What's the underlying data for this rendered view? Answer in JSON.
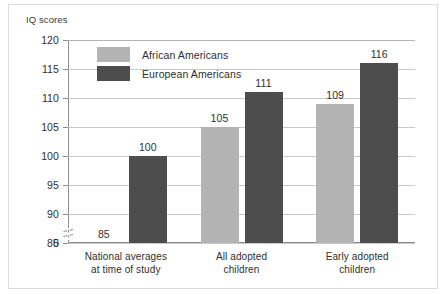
{
  "figure": {
    "axis_title": "IQ scores",
    "colors": {
      "series_light": "#b3b3b3",
      "series_dark": "#4d4d4d",
      "gridline": "#c9c9c9",
      "axis": "#8c8c8c",
      "text": "#2f2f2f",
      "frame": "#dcdcdc",
      "background": "#ffffff"
    }
  },
  "chart_data": {
    "type": "bar",
    "title": "",
    "subtitle": "",
    "xlabel": "",
    "ylabel": "IQ scores",
    "ylim": [
      85,
      120
    ],
    "yticks": [
      85,
      90,
      95,
      100,
      105,
      110,
      115,
      120
    ],
    "ytick_labels": [
      "85",
      "90",
      "95",
      "100",
      "105",
      "110",
      "115",
      "120"
    ],
    "axis_break": true,
    "axis_break_label": "0",
    "grid": true,
    "grid_axis": "y",
    "legend_position": "inside-top-left",
    "categories": [
      "National averages at time of study",
      "All adopted children",
      "Early adopted children"
    ],
    "category_lines": [
      [
        "National averages",
        "at time of study"
      ],
      [
        "All adopted",
        "children"
      ],
      [
        "Early adopted",
        "children"
      ]
    ],
    "series": [
      {
        "name": "African Americans",
        "color": "#b3b3b3",
        "values": [
          85,
          105,
          109
        ],
        "value_labels": [
          "85",
          "105",
          "109"
        ]
      },
      {
        "name": "European Americans",
        "color": "#4d4d4d",
        "values": [
          100,
          111,
          116
        ],
        "value_labels": [
          "100",
          "111",
          "116"
        ]
      }
    ]
  }
}
